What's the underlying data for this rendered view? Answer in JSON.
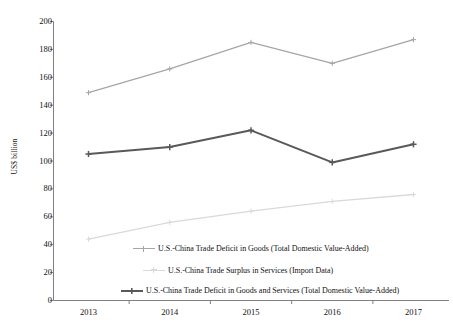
{
  "chart_data": {
    "type": "line",
    "title": "",
    "subtitle": "",
    "xlabel": "",
    "ylabel": "US$ billion",
    "categories": [
      "2013",
      "2014",
      "2015",
      "2016",
      "2017"
    ],
    "x": [
      2013,
      2014,
      2015,
      2016,
      2017
    ],
    "ylim": [
      0,
      200
    ],
    "yticks": [
      0,
      20,
      40,
      60,
      80,
      100,
      120,
      140,
      160,
      180,
      200
    ],
    "grid": false,
    "legend_position": "inside-bottom",
    "series": [
      {
        "name": "U.S.-China Trade Deficit in Goods (Total Domestic Value-Added)",
        "values": [
          149,
          166,
          185,
          170,
          187
        ],
        "color": "#a6a6a6",
        "marker": "plus"
      },
      {
        "name": "U.S.-China Trade Surplus in Services (Import Data)",
        "values": [
          44,
          56,
          64,
          71,
          76
        ],
        "color": "#d9d9d9",
        "marker": "plus"
      },
      {
        "name": "U.S.-China Trade Deficit in Goods and Services (Total Domestic Value-Added)",
        "values": [
          105,
          110,
          122,
          99,
          112
        ],
        "color": "#595959",
        "marker": "plus"
      }
    ]
  },
  "axes": {
    "y_axis_label": "US$ billion",
    "y_tick_labels": [
      "200",
      "180",
      "160",
      "140",
      "120",
      "100",
      "80",
      "60",
      "40",
      "20",
      "0"
    ],
    "x_tick_labels": [
      "2013",
      "2014",
      "2015",
      "2016",
      "2017"
    ],
    "axis_color": "#808080"
  },
  "legend": {
    "items": [
      {
        "label": "U.S.-China Trade Deficit in Goods (Total Domestic Value-Added)",
        "color": "#a6a6a6"
      },
      {
        "label": "U.S.-China Trade Surplus in Services (Import Data)",
        "color": "#d9d9d9"
      },
      {
        "label": "U.S.-China Trade Deficit in Goods and Services (Total Domestic Value-Added)",
        "color": "#595959"
      }
    ]
  }
}
